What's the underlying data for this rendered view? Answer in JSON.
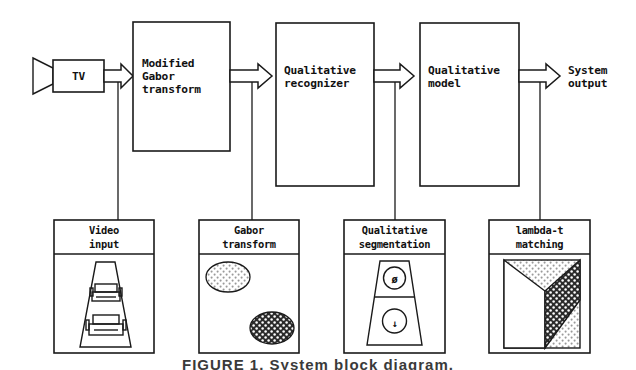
{
  "figure": {
    "caption": "FIGURE 1. System block diagram.",
    "line_color": "#1a1a1a",
    "fill_color": "#ffffff",
    "dark_fill": "#2b2b2b",
    "light_fill": "#e9e9e9"
  },
  "pipeline": {
    "source_icon": "tv-camera-icon",
    "stages": [
      {
        "id": "tv",
        "label": "TV",
        "lines": [
          "TV"
        ]
      },
      {
        "id": "gabor",
        "label": "Modified Gabor transform",
        "lines": [
          "Modified",
          "Gabor",
          "transform"
        ]
      },
      {
        "id": "recognizer",
        "label": "Qualitative recognizer",
        "lines": [
          "Qualitative",
          "recognizer"
        ]
      },
      {
        "id": "model",
        "label": "Qualitative model",
        "lines": [
          "Qualitative",
          "model"
        ]
      }
    ],
    "output": {
      "id": "output",
      "label": "System output",
      "lines": [
        "System",
        "output"
      ]
    },
    "arrows": [
      "arrow-tv-to-gabor",
      "arrow-gabor-to-recognizer",
      "arrow-recognizer-to-model",
      "arrow-model-to-output"
    ]
  },
  "thumbnails": [
    {
      "id": "video-input",
      "lines": [
        "Video",
        "input"
      ],
      "content": "road-with-two-cars",
      "content_desc": "Trapezoidal road with two vehicles seen from behind"
    },
    {
      "id": "gabor-transform",
      "lines": [
        "Gabor",
        "transform"
      ],
      "content": "two-dotted-ellipses",
      "content_desc": "Light stippled ellipse upper-left, dark stippled ellipse lower-right"
    },
    {
      "id": "qualitative-segmentation",
      "lines": [
        "Qualitative",
        "segmentation"
      ],
      "content": "trapezoid-two-regions",
      "content_desc": "Trapezoid split horizontally; upper circle marked with a slashed-zero symbol, lower circle marked with a down arrow",
      "symbols": [
        "ø",
        "↓"
      ]
    },
    {
      "id": "lambda-t-matching",
      "lines": [
        "lambda-t",
        "matching"
      ],
      "content": "dark-wedge-stipple",
      "content_desc": "Dark stippled wedge over a light stippled background inside a frame"
    }
  ]
}
